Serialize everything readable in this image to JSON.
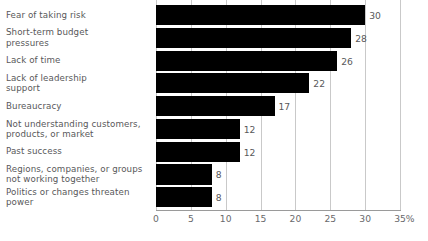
{
  "chart_data": {
    "type": "bar",
    "orientation": "horizontal",
    "title": "",
    "xlabel": "%",
    "ylabel": "",
    "xlim": [
      0,
      35
    ],
    "grid": true,
    "legend": null,
    "axis_unit": "%",
    "tick_labels": [
      "0",
      "5",
      "10",
      "15",
      "20",
      "25",
      "30",
      "35"
    ],
    "tick_values": [
      0,
      5,
      10,
      15,
      20,
      25,
      30,
      35
    ],
    "categories": [
      "Fear of taking risk",
      "Short-term budget\npressures",
      "Lack of time",
      "Lack of leadership\nsupport",
      "Bureaucracy",
      "Not understanding customers,\nproducts, or market",
      "Past success",
      "Regions, companies, or groups\nnot working together",
      "Politics or changes threaten\npower"
    ],
    "values": [
      30,
      28,
      26,
      22,
      17,
      12,
      12,
      8,
      8
    ],
    "value_labels": [
      "30",
      "28",
      "26",
      "22",
      "17",
      "12",
      "12",
      "8",
      "8"
    ],
    "colors": {
      "bar": "#000000",
      "gridline": "#c9c9c9",
      "axis": "#9a9a9a",
      "label_text": "#58585a",
      "tick_text": "#6a6a6c",
      "background": "#ffffff"
    }
  }
}
